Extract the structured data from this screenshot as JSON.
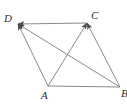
{
  "figure": {
    "kind": "geometry-diagram",
    "background_color": "#ffffff",
    "stroke_color": "#8a8a8a",
    "label_color": "#2e2e2e",
    "stroke_width": 1,
    "viewbox": "0 0 127 112",
    "vertices": [
      {
        "id": "D",
        "label": "D",
        "x": 18,
        "y": 24,
        "label_x": 4,
        "label_y": 13
      },
      {
        "id": "C",
        "label": "C",
        "x": 87,
        "y": 23,
        "label_x": 91,
        "label_y": 10
      },
      {
        "id": "A",
        "label": "A",
        "x": 48,
        "y": 86,
        "label_x": 41,
        "label_y": 90
      },
      {
        "id": "B",
        "label": "B",
        "x": 120,
        "y": 87,
        "label_x": 121,
        "label_y": 88
      }
    ],
    "edges": [
      {
        "id": "DC",
        "from": "D",
        "to": "C",
        "x1": 18,
        "y1": 24,
        "x2": 87,
        "y2": 23,
        "arrow_at_end": false,
        "arrow_at_start": true
      },
      {
        "id": "AB",
        "from": "A",
        "to": "B",
        "x1": 48,
        "y1": 86,
        "x2": 120,
        "y2": 87,
        "arrow_at_end": false,
        "arrow_at_start": false
      },
      {
        "id": "DA",
        "from": "D",
        "to": "A",
        "x1": 18,
        "y1": 24,
        "x2": 48,
        "y2": 86,
        "arrow_at_end": false,
        "arrow_at_start": true
      },
      {
        "id": "CB",
        "from": "C",
        "to": "B",
        "x1": 87,
        "y1": 23,
        "x2": 120,
        "y2": 87,
        "arrow_at_end": false,
        "arrow_at_start": true
      }
    ],
    "diagonals": [
      {
        "id": "DB",
        "from": "D",
        "to": "B",
        "x1": 120,
        "y1": 87,
        "x2": 18,
        "y2": 24,
        "arrow_at_end": true
      },
      {
        "id": "AC",
        "from": "A",
        "to": "C",
        "x1": 48,
        "y1": 86,
        "x2": 87,
        "y2": 23,
        "arrow_at_end": true
      }
    ],
    "arrowheads": [
      {
        "id": "arrow-into-D",
        "target": "D"
      },
      {
        "id": "arrow-into-C",
        "target": "C"
      }
    ],
    "intersection": {
      "id": "diagonal-intersection",
      "x": 67,
      "y": 56
    }
  }
}
